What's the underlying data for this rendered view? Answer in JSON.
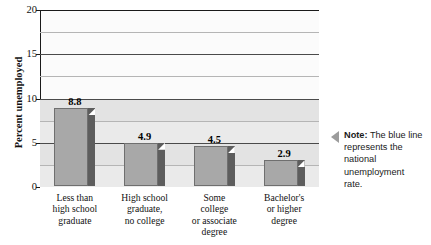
{
  "chart_data": {
    "type": "bar",
    "title": "",
    "xlabel": "",
    "ylabel": "Percent unemployed",
    "ylim": [
      0,
      20
    ],
    "yticks": [
      0,
      5,
      10,
      15,
      20
    ],
    "ytick_labels": [
      "0",
      "5",
      "10",
      "15",
      "20"
    ],
    "minor_gridlines": [
      2.5,
      7.5,
      12.5,
      17.5
    ],
    "grid": true,
    "legend": "none",
    "categories": [
      "Less than high school graduate",
      "High school graduate, no college",
      "Some college or associate degree",
      "Bachelor's or higher degree"
    ],
    "category_lines": [
      [
        "Less than",
        "high school",
        "graduate"
      ],
      [
        "High school",
        "graduate,",
        "no college"
      ],
      [
        "Some",
        "college",
        "or associate",
        "degree"
      ],
      [
        "Bachelor's",
        "or higher",
        "degree"
      ]
    ],
    "values": [
      8.8,
      4.9,
      4.5,
      2.9
    ],
    "value_labels": [
      "8.8",
      "4.9",
      "4.5",
      "2.9"
    ],
    "bar_color": "#a8a8a8",
    "bar_side_color": "#5d5d5d"
  },
  "note": {
    "label": "Note:",
    "text": "The blue line represents the national unemployment rate."
  }
}
